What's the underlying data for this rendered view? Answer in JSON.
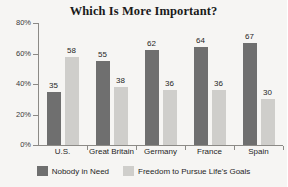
{
  "chart_data": {
    "type": "bar",
    "title": "Which Is More Important?",
    "xlabel": "",
    "ylabel": "",
    "ylim": [
      0,
      80
    ],
    "grid": false,
    "legend_position": "bottom",
    "y_ticks": [
      "0%",
      "20%",
      "40%",
      "60%",
      "80%"
    ],
    "y_tick_values": [
      0,
      20,
      40,
      60,
      80
    ],
    "categories": [
      "U.S.",
      "Great Britain",
      "Germany",
      "France",
      "Spain"
    ],
    "series": [
      {
        "name": "Nobody in Need",
        "color": "#6f6f6f",
        "values": [
          35,
          55,
          62,
          64,
          67
        ]
      },
      {
        "name": "Freedom to Pursue Life's Goals",
        "color": "#cfcecb",
        "values": [
          58,
          38,
          36,
          36,
          30
        ]
      }
    ]
  },
  "legend": {
    "items": [
      {
        "label": "Nobody in Need",
        "color": "#6f6f6f"
      },
      {
        "label": "Freedom to Pursue Life's Goals",
        "color": "#cfcecb"
      }
    ]
  },
  "colors": {
    "background": "#f6f5f3",
    "axis": "#8c8a86",
    "text": "#1f1f1f",
    "series_dark": "#6f6f6f",
    "series_light": "#cfcecb"
  }
}
